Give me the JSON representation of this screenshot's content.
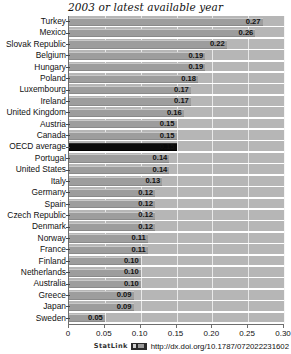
{
  "chart_data": {
    "type": "bar",
    "orientation": "horizontal",
    "title": "2003 or latest available year",
    "xlabel": "",
    "ylabel": "",
    "xlim": [
      0,
      0.3
    ],
    "xticks": [
      "0",
      "0.05",
      "0.10",
      "0.15",
      "0.20",
      "0.25",
      "0.30"
    ],
    "xtick_values": [
      0,
      0.05,
      0.1,
      0.15,
      0.2,
      0.25,
      0.3
    ],
    "grid": "vertical",
    "legend": "none",
    "categories": [
      "Turkey",
      "Mexico",
      "Slovak Republic",
      "Belgium",
      "Hungary",
      "Poland",
      "Luxembourg",
      "Ireland",
      "United Kingdom",
      "Austria",
      "Canada",
      "OECD average",
      "Portugal",
      "United States",
      "Italy",
      "Germany",
      "Spain",
      "Czech Republic",
      "Denmark",
      "Norway",
      "France",
      "Finland",
      "Netherlands",
      "Australia",
      "Greece",
      "Japan",
      "Sweden"
    ],
    "values": [
      0.27,
      0.26,
      0.22,
      0.19,
      0.19,
      0.18,
      0.17,
      0.17,
      0.16,
      0.15,
      0.15,
      0.15,
      0.14,
      0.14,
      0.13,
      0.12,
      0.12,
      0.12,
      0.12,
      0.11,
      0.11,
      0.1,
      0.1,
      0.1,
      0.09,
      0.09,
      0.05
    ],
    "data_labels": [
      "0.27",
      "0.26",
      "0.22",
      "0.19",
      "0.19",
      "0.18",
      "0.17",
      "0.17",
      "0.16",
      "0.15",
      "0.15",
      "0.15",
      "0.14",
      "0.14",
      "0.13",
      "0.12",
      "0.12",
      "0.12",
      "0.12",
      "0.11",
      "0.11",
      "0.10",
      "0.10",
      "0.10",
      "0.09",
      "0.09",
      "0.05"
    ],
    "highlight_category": "OECD average",
    "colors": {
      "bar": "#9d9d9d",
      "highlight_bar": "#0a0a0a",
      "plot_background": "#b6b6b6",
      "gridline": "#f2f2f2",
      "axis": "#6e6e6e",
      "text": "#111111"
    }
  },
  "footer": {
    "statlink_label": "StatLink",
    "badge_icon": "statlink-badge-icon",
    "url": "http://dx.doi.org/10.1787/072022231602"
  }
}
